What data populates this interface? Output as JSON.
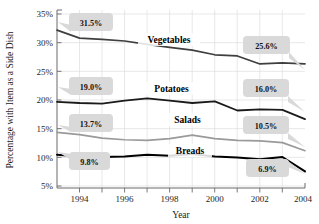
{
  "chart_data": {
    "type": "line",
    "title": "",
    "xlabel": "Year",
    "ylabel": "Percentage with Item as a Side Dish",
    "x": [
      1993,
      1994,
      1995,
      1996,
      1997,
      1998,
      1999,
      2000,
      2001,
      2002,
      2003,
      2004
    ],
    "xlim": [
      1993,
      2004
    ],
    "ylim": [
      4,
      35
    ],
    "xticks": [
      1993,
      1994,
      1995,
      1996,
      1997,
      1998,
      1999,
      2000,
      2001,
      2002,
      2003,
      2004
    ],
    "xticklabels": [
      "",
      "1994",
      "",
      "1996",
      "",
      "1998",
      "",
      "2000",
      "",
      "2002",
      "",
      "2004"
    ],
    "yticks": [
      5,
      10,
      15,
      20,
      25,
      30,
      35
    ],
    "yticklabels": [
      "5%",
      "10%",
      "15%",
      "20%",
      "25%",
      "30%",
      "35%"
    ],
    "grid": true,
    "legend": "inline-series-labels",
    "series": [
      {
        "name": "Vegetables",
        "color": "#3f3f3f",
        "width": 1.7,
        "values": [
          31.5,
          30.1,
          29.9,
          29.6,
          29.0,
          28.5,
          28.0,
          27.2,
          27.0,
          25.6,
          25.8,
          25.6
        ],
        "start_value": "31.5%",
        "end_value": "25.6%"
      },
      {
        "name": "Potatoes",
        "color": "#1a1a1a",
        "width": 1.8,
        "values": [
          19.0,
          18.8,
          18.7,
          19.2,
          19.6,
          19.2,
          18.8,
          19.1,
          17.5,
          17.7,
          17.6,
          16.0
        ],
        "start_value": "19.0%",
        "end_value": "16.0%"
      },
      {
        "name": "Salads",
        "color": "#9a9a9a",
        "width": 1.7,
        "values": [
          13.7,
          13.3,
          12.7,
          12.4,
          12.3,
          12.6,
          13.2,
          12.6,
          12.3,
          12.2,
          11.9,
          10.5
        ],
        "start_value": "13.7%",
        "end_value": "10.5%"
      },
      {
        "name": "Breads",
        "color": "#000000",
        "width": 2.0,
        "values": [
          9.8,
          9.5,
          9.4,
          9.5,
          9.8,
          9.6,
          9.9,
          9.5,
          9.3,
          9.0,
          9.4,
          6.9
        ],
        "start_value": "9.8%",
        "end_value": "6.9%"
      }
    ],
    "annotations": [
      {
        "text": "31.5%",
        "series": "Vegetables",
        "position": "start"
      },
      {
        "text": "25.6%",
        "series": "Vegetables",
        "position": "end"
      },
      {
        "text": "19.0%",
        "series": "Potatoes",
        "position": "start"
      },
      {
        "text": "16.0%",
        "series": "Potatoes",
        "position": "end"
      },
      {
        "text": "13.7%",
        "series": "Salads",
        "position": "start"
      },
      {
        "text": "10.5%",
        "series": "Salads",
        "position": "end"
      },
      {
        "text": "9.8%",
        "series": "Breads",
        "position": "start"
      },
      {
        "text": "6.9%",
        "series": "Breads",
        "position": "end"
      }
    ]
  },
  "axes": {
    "y_title": "Percentage with Item as a Side Dish",
    "x_title": "Year",
    "y_labels": [
      "35%",
      "30%",
      "25%",
      "20%",
      "15%",
      "10%",
      "5%"
    ],
    "x_labels": [
      "1994",
      "1996",
      "1998",
      "2000",
      "2002",
      "2004"
    ]
  },
  "series_labels": {
    "vegetables": "Vegetables",
    "potatoes": "Potatoes",
    "salads": "Salads",
    "breads": "Breads"
  },
  "callouts": {
    "veg_start": "31.5%",
    "veg_end": "25.6%",
    "pot_start": "19.0%",
    "pot_end": "16.0%",
    "sal_start": "13.7%",
    "sal_end": "10.5%",
    "bre_start": "9.8%",
    "bre_end": "6.9%"
  }
}
